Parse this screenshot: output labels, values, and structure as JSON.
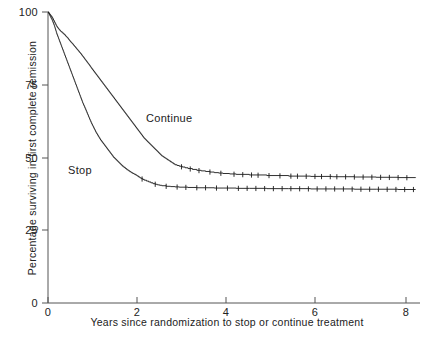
{
  "figure": {
    "background_color": "#ffffff",
    "ink_color": "#1a1a1a"
  },
  "axes": {
    "x_title": "Years since randomization to stop or continue treatment",
    "y_title": "Percentage surviving in first complete remission",
    "x_ticks": [
      "0",
      "2",
      "4",
      "6",
      "8"
    ],
    "y_ticks": [
      "0",
      "25",
      "50",
      "75",
      "100"
    ]
  },
  "annotations": {
    "continue_label": "Continue",
    "stop_label": "Stop"
  },
  "chart_data": {
    "type": "line",
    "subtype": "kaplan-meier-survival-step",
    "title": "",
    "subtitle": "",
    "xlabel": "Years since randomization to stop or continue treatment",
    "ylabel": "Percentage surviving in first complete remission",
    "xlim": [
      0,
      8.5
    ],
    "ylim": [
      0,
      100
    ],
    "xticks": [
      0,
      2,
      4,
      6,
      8
    ],
    "yticks": [
      0,
      25,
      50,
      75,
      100
    ],
    "grid": false,
    "legend": "inline-annotations",
    "legend_position": "inline",
    "series": [
      {
        "name": "Continue",
        "color": "#1a1a1a",
        "style": "step-with-censor-ticks",
        "label_position": {
          "x": 2.2,
          "y": 57
        },
        "x": [
          0.0,
          0.05,
          0.1,
          0.15,
          0.2,
          0.25,
          0.3,
          0.35,
          0.4,
          0.45,
          0.5,
          0.55,
          0.6,
          0.65,
          0.7,
          0.75,
          0.8,
          0.85,
          0.9,
          0.95,
          1.0,
          1.1,
          1.2,
          1.3,
          1.4,
          1.5,
          1.6,
          1.7,
          1.8,
          1.9,
          2.0,
          2.1,
          2.2,
          2.3,
          2.4,
          2.5,
          2.6,
          2.7,
          2.8,
          2.9,
          3.0,
          3.2,
          3.4,
          3.6,
          3.8,
          4.0,
          4.3,
          4.6,
          5.0,
          5.5,
          6.0,
          6.5,
          7.0,
          7.5,
          8.0,
          8.4
        ],
        "y": [
          100.0,
          99.0,
          98.0,
          96.5,
          95.0,
          94.0,
          93.2,
          92.5,
          91.8,
          91.0,
          90.0,
          89.2,
          88.3,
          87.4,
          86.5,
          85.6,
          84.6,
          83.6,
          82.6,
          81.6,
          80.5,
          78.5,
          76.5,
          74.5,
          72.5,
          70.5,
          68.5,
          66.5,
          64.5,
          62.5,
          60.5,
          58.5,
          56.5,
          55.0,
          53.5,
          52.0,
          50.5,
          49.5,
          48.5,
          47.5,
          47.0,
          46.2,
          45.6,
          45.2,
          44.8,
          44.5,
          44.2,
          44.0,
          43.8,
          43.6,
          43.5,
          43.4,
          43.3,
          43.2,
          43.1,
          43.0
        ],
        "censor_times": [
          3.05,
          3.25,
          3.45,
          3.7,
          3.95,
          4.25,
          4.45,
          4.65,
          4.8,
          5.05,
          5.3,
          5.55,
          5.7,
          5.9,
          6.1,
          6.25,
          6.45,
          6.6,
          6.8,
          7.0,
          7.2,
          7.4,
          7.6,
          7.8,
          8.0,
          8.2
        ],
        "plateau_value": 43
      },
      {
        "name": "Stop",
        "color": "#1a1a1a",
        "style": "step-with-censor-ticks",
        "label_position": {
          "x": 0.5,
          "y": 47
        },
        "x": [
          0.0,
          0.05,
          0.1,
          0.15,
          0.2,
          0.25,
          0.3,
          0.35,
          0.4,
          0.45,
          0.5,
          0.55,
          0.6,
          0.65,
          0.7,
          0.75,
          0.8,
          0.85,
          0.9,
          0.95,
          1.0,
          1.1,
          1.2,
          1.3,
          1.4,
          1.5,
          1.6,
          1.7,
          1.8,
          1.9,
          2.0,
          2.1,
          2.2,
          2.3,
          2.4,
          2.5,
          2.6,
          2.7,
          2.8,
          2.9,
          3.0,
          3.2,
          3.4,
          3.6,
          3.8,
          4.0,
          4.3,
          4.6,
          5.0,
          5.5,
          6.0,
          6.5,
          7.0,
          7.5,
          8.0,
          8.4
        ],
        "y": [
          100.0,
          98.5,
          97.0,
          95.0,
          92.5,
          90.5,
          88.5,
          86.5,
          84.5,
          82.5,
          80.5,
          78.5,
          76.5,
          74.5,
          72.5,
          70.5,
          68.5,
          66.8,
          65.0,
          63.2,
          61.5,
          58.5,
          56.0,
          54.0,
          52.0,
          50.0,
          48.5,
          47.0,
          45.8,
          44.8,
          44.0,
          43.0,
          42.2,
          41.6,
          41.0,
          40.6,
          40.3,
          40.1,
          40.0,
          39.9,
          39.8,
          39.7,
          39.6,
          39.6,
          39.5,
          39.5,
          39.4,
          39.4,
          39.3,
          39.3,
          39.2,
          39.2,
          39.1,
          39.1,
          39.0,
          39.0
        ],
        "censor_times": [
          2.15,
          2.45,
          2.7,
          2.95,
          3.15,
          3.4,
          3.6,
          3.85,
          4.1,
          4.35,
          4.55,
          4.75,
          4.95,
          5.15,
          5.35,
          5.55,
          5.75,
          5.95,
          6.15,
          6.35,
          6.55,
          6.75,
          6.95,
          7.15,
          7.35,
          7.55,
          7.75,
          7.95,
          8.15,
          8.35
        ],
        "plateau_value": 39
      }
    ]
  }
}
